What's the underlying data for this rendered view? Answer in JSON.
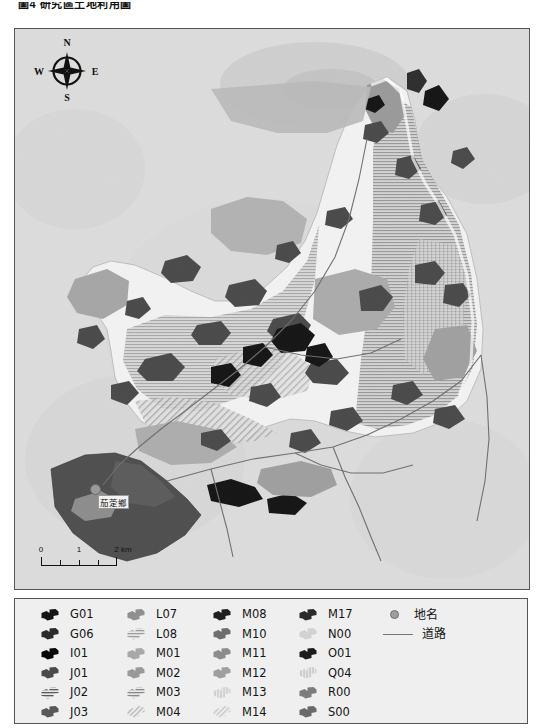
{
  "header": {
    "title": "圖4 研究區土地利用圖"
  },
  "map": {
    "compass": {
      "north": "N",
      "east": "E",
      "south": "S",
      "west": "W"
    },
    "scalebar": {
      "t0": "0",
      "t1": "1",
      "t2": "2 km"
    },
    "place_label": "茄萣鄉",
    "background_color": "#d9d9d9"
  },
  "legend": {
    "columns": [
      {
        "items": [
          {
            "code": "G01",
            "fill": "#141414",
            "pattern": "solid"
          },
          {
            "code": "G06",
            "fill": "#2b2b2b",
            "pattern": "solid"
          },
          {
            "code": "I01",
            "fill": "#070707",
            "pattern": "solid"
          },
          {
            "code": "J01",
            "fill": "#4a4a4a",
            "pattern": "solid"
          },
          {
            "code": "J02",
            "fill": "#5a5a5a",
            "pattern": "hatch-h"
          },
          {
            "code": "J03",
            "fill": "#585858",
            "pattern": "solid"
          }
        ]
      },
      {
        "items": [
          {
            "code": "L07",
            "fill": "#8f8f8f",
            "pattern": "solid"
          },
          {
            "code": "L08",
            "fill": "#9c9c9c",
            "pattern": "hatch-h"
          },
          {
            "code": "M01",
            "fill": "#a8a8a8",
            "pattern": "solid"
          },
          {
            "code": "M02",
            "fill": "#9a9a9a",
            "pattern": "solid"
          },
          {
            "code": "M03",
            "fill": "#8a8a8a",
            "pattern": "hatch-h"
          },
          {
            "code": "M04",
            "fill": "#b0b0b0",
            "pattern": "hatch-d"
          }
        ]
      },
      {
        "items": [
          {
            "code": "M08",
            "fill": "#1f1f1f",
            "pattern": "solid"
          },
          {
            "code": "M10",
            "fill": "#6e6e6e",
            "pattern": "solid"
          },
          {
            "code": "M11",
            "fill": "#8c8c8c",
            "pattern": "solid"
          },
          {
            "code": "M12",
            "fill": "#9f9f9f",
            "pattern": "solid"
          },
          {
            "code": "M13",
            "fill": "#bdbdbd",
            "pattern": "hatch-v"
          },
          {
            "code": "M14",
            "fill": "#c4c4c4",
            "pattern": "hatch-d"
          }
        ]
      },
      {
        "items": [
          {
            "code": "M17",
            "fill": "#2a2a2a",
            "pattern": "solid"
          },
          {
            "code": "N00",
            "fill": "#d2d2d2",
            "pattern": "solid"
          },
          {
            "code": "O01",
            "fill": "#1c1c1c",
            "pattern": "solid"
          },
          {
            "code": "Q04",
            "fill": "#b6b6b6",
            "pattern": "hatch-v"
          },
          {
            "code": "R00",
            "fill": "#7d7d7d",
            "pattern": "solid"
          },
          {
            "code": "S00",
            "fill": "#6a6a6a",
            "pattern": "solid"
          }
        ]
      }
    ],
    "symbols": [
      {
        "label": "地名",
        "type": "point",
        "color": "#9e9e9e"
      },
      {
        "label": "道路",
        "type": "line",
        "color": "#777777"
      }
    ]
  }
}
